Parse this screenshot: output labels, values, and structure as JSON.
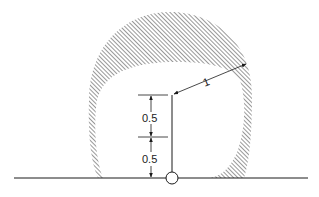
{
  "diagram": {
    "labels": {
      "radius": "1",
      "upper_segment": "0.5",
      "lower_segment": "0.5"
    },
    "colors": {
      "stroke": "#1a1a1a",
      "hatch": "#444444",
      "background": "#ffffff"
    }
  }
}
